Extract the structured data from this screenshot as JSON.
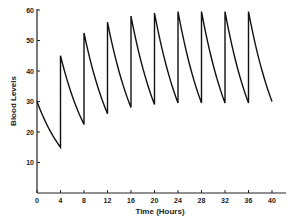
{
  "chart_data": {
    "type": "line",
    "title": "",
    "xlabel": "Time (Hours)",
    "ylabel": "Blood Levels",
    "xlim": [
      0,
      40
    ],
    "ylim": [
      0,
      60
    ],
    "x_ticks": [
      0,
      4,
      8,
      12,
      16,
      20,
      24,
      28,
      32,
      36,
      40
    ],
    "y_ticks": [
      10,
      20,
      30,
      40,
      50,
      60
    ],
    "grid": false,
    "legend": null,
    "series": [
      {
        "name": "Blood level",
        "dose_interval_hours": 4,
        "points": [
          [
            0,
            30
          ],
          [
            4,
            15
          ],
          [
            4,
            45
          ],
          [
            8,
            22.5
          ],
          [
            8,
            52.5
          ],
          [
            12,
            26
          ],
          [
            12,
            56
          ],
          [
            16,
            28
          ],
          [
            16,
            58
          ],
          [
            20,
            29
          ],
          [
            20,
            59
          ],
          [
            24,
            29.5
          ],
          [
            24,
            59.5
          ],
          [
            28,
            29.5
          ],
          [
            28,
            59.5
          ],
          [
            32,
            29.5
          ],
          [
            32,
            59.5
          ],
          [
            36,
            29.5
          ],
          [
            36,
            59.5
          ],
          [
            40,
            30
          ]
        ]
      }
    ]
  },
  "axes": {
    "x_title": "Time (Hours)",
    "y_title": "Blood Levels"
  }
}
